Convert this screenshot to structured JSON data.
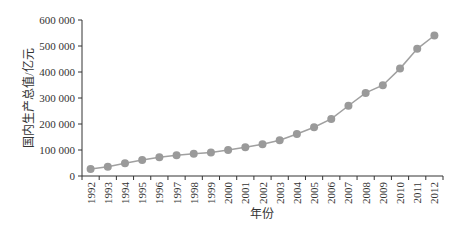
{
  "chart_data": {
    "type": "line",
    "title": "",
    "xlabel": "年份",
    "ylabel": "国内生产总值/亿元",
    "ylim": [
      0,
      600000
    ],
    "yticks": [
      0,
      100000,
      200000,
      300000,
      400000,
      500000,
      600000
    ],
    "ytick_labels": [
      "0",
      "100 000",
      "200 000",
      "300 000",
      "400 000",
      "500 000",
      "600 000"
    ],
    "grid": false,
    "legend": null,
    "categories": [
      "1992",
      "1993",
      "1994",
      "1995",
      "1996",
      "1997",
      "1998",
      "1999",
      "2000",
      "2001",
      "2002",
      "2003",
      "2004",
      "2005",
      "2006",
      "2007",
      "2008",
      "2009",
      "2010",
      "2011",
      "2012"
    ],
    "series": [
      {
        "name": "国内生产总值",
        "color": "#9a9a9a",
        "marker": "circle",
        "values": [
          27195,
          35673,
          48638,
          61340,
          71814,
          79715,
          85196,
          90564,
          100280,
          110863,
          121717,
          137422,
          161840,
          187319,
          219439,
          270232,
          319516,
          349081,
          413030,
          489301,
          540367
        ]
      }
    ]
  },
  "style": {
    "axis_color": "#333333",
    "line_color": "#a0a0a0",
    "marker_color": "#9a9a9a"
  }
}
